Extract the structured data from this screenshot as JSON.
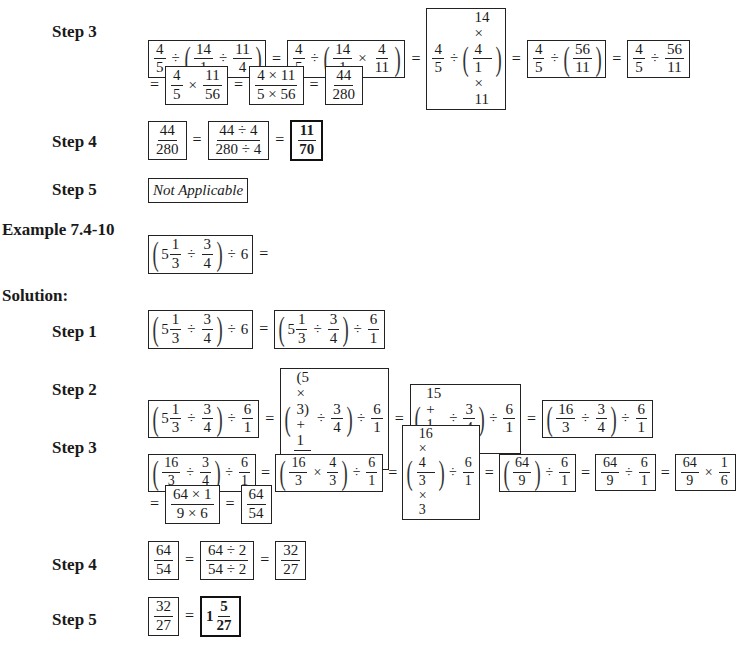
{
  "example_title": "Example 7.4-10",
  "solution_label": "Solution:",
  "problem_expression": "(5 1/3 ÷ 3/4) ÷ 6 =",
  "previous_example": {
    "step3": {
      "label": "Step 3",
      "line1": [
        "4/5 ÷ (14/1 ÷ 11/4)",
        "4/5 ÷ (14/1 × 4/11)",
        "4/5 ÷ ((14 × 4)/(1 × 11))",
        "4/5 ÷ (56/11)",
        "4/5 ÷ 56/11"
      ],
      "line2": [
        "4/5 × 11/56",
        "(4 × 11)/(5 × 56)",
        "44/280"
      ]
    },
    "step4": {
      "label": "Step 4",
      "terms": [
        "44/280",
        "(44 ÷ 4)/(280 ÷ 4)",
        "11/70"
      ]
    },
    "step5": {
      "label": "Step 5",
      "text": "Not Applicable"
    }
  },
  "steps": [
    {
      "label": "Step 1",
      "terms": [
        "(5 1/3 ÷ 3/4) ÷ 6",
        "(5 1/3 ÷ 3/4) ÷ 6/1"
      ]
    },
    {
      "label": "Step 2",
      "terms": [
        "(5 1/3 ÷ 3/4) ÷ 6/1",
        "(((5 × 3) + 1)/3 ÷ 3/4) ÷ 6/1",
        "((15 + 1)/3 ÷ 3/4) ÷ 6/1",
        "(16/3 ÷ 3/4) ÷ 6/1"
      ]
    },
    {
      "label": "Step 3",
      "terms": [
        "(16/3 ÷ 3/4) ÷ 6/1",
        "(16/3 × 4/3) ÷ 6/1",
        "((16 × 4)/(3 × 3)) ÷ 6/1",
        "(64/9) ÷ 6/1",
        "64/9 ÷ 6/1",
        "64/9 × 1/6"
      ],
      "line2": [
        "(64 × 1)/(9 × 6)",
        "64/54"
      ]
    },
    {
      "label": "Step 4",
      "terms": [
        "64/54",
        "(64 ÷ 2)/(54 ÷ 2)",
        "32/27"
      ]
    },
    {
      "label": "Step 5",
      "terms": [
        "32/27",
        "1 5/27"
      ]
    }
  ],
  "labels": {
    "s3a": "Step 3",
    "s4a": "Step 4",
    "s5a": "Step 5",
    "s1": "Step 1",
    "s2": "Step 2",
    "s3": "Step 3",
    "s4": "Step 4",
    "s5": "Step 5",
    "not_applicable": "Not Applicable"
  }
}
